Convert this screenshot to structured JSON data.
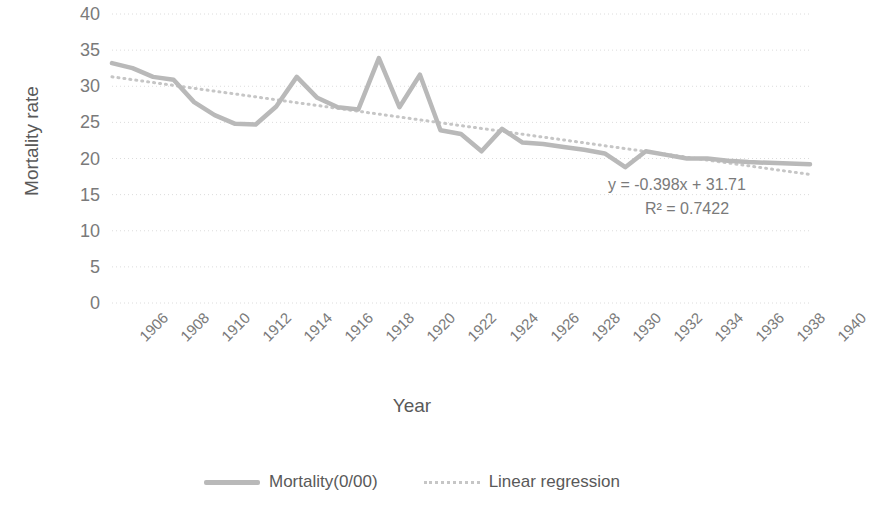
{
  "chart_data": {
    "type": "line",
    "title": "",
    "xlabel": "Year",
    "ylabel": "Mortality rate",
    "xlim": [
      1906,
      1940
    ],
    "ylim": [
      0,
      40
    ],
    "ytick_values": [
      0,
      5,
      10,
      15,
      20,
      25,
      30,
      35,
      40
    ],
    "xtick_values": [
      1906,
      1908,
      1910,
      1912,
      1914,
      1916,
      1918,
      1920,
      1922,
      1924,
      1926,
      1928,
      1930,
      1932,
      1934,
      1936,
      1938,
      1940
    ],
    "grid": "horizontal-dotted",
    "legend_position": "bottom",
    "x": [
      1906,
      1907,
      1908,
      1909,
      1910,
      1911,
      1912,
      1913,
      1914,
      1915,
      1916,
      1917,
      1918,
      1919,
      1920,
      1921,
      1922,
      1923,
      1924,
      1925,
      1926,
      1927,
      1928,
      1929,
      1930,
      1931,
      1932,
      1933,
      1934,
      1935,
      1936,
      1937,
      1938,
      1939,
      1940
    ],
    "series": [
      {
        "name": "Mortality(0/00)",
        "style": "solid",
        "color": "#b9b9b9",
        "values": [
          33.2,
          32.5,
          31.3,
          30.9,
          27.8,
          26.0,
          24.8,
          24.7,
          27.2,
          31.3,
          28.4,
          27.1,
          26.8,
          33.9,
          27.1,
          31.6,
          23.9,
          23.4,
          21.0,
          24.1,
          22.2,
          22.0,
          21.6,
          21.2,
          20.7,
          18.8,
          21.0,
          20.5,
          20.0,
          20.0,
          19.7,
          19.5,
          19.4,
          19.3,
          19.2
        ]
      },
      {
        "name": "Linear regression",
        "style": "dotted",
        "color": "#c6c6c6",
        "equation": "y = -0.398x + 31.71",
        "r_squared": "R² = 0.7422",
        "slope": -0.398,
        "intercept": 31.71,
        "values": [
          31.31,
          30.91,
          30.52,
          30.12,
          29.72,
          29.32,
          28.93,
          28.53,
          28.13,
          27.73,
          27.34,
          26.94,
          26.54,
          26.14,
          25.75,
          25.35,
          24.95,
          24.55,
          24.16,
          23.76,
          23.36,
          22.96,
          22.57,
          22.17,
          21.77,
          21.37,
          20.98,
          20.58,
          20.18,
          19.78,
          19.39,
          18.99,
          18.59,
          18.19,
          17.8
        ]
      }
    ],
    "annotations": [
      {
        "name": "regression-equation",
        "text": "y = -0.398x + 31.71"
      },
      {
        "name": "r-squared",
        "text": "R² = 0.7422"
      }
    ]
  },
  "legend": {
    "items": [
      {
        "label": "Mortality(0/00)",
        "style": "solid"
      },
      {
        "label": "Linear regression",
        "style": "dotted"
      }
    ]
  }
}
